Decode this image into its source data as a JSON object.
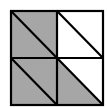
{
  "diagram": {
    "colors": {
      "shaded": "#a6a6a6",
      "unshaded": "#ffffff",
      "stroke": "#000000"
    },
    "cells": [
      {
        "position": "top-left",
        "upper_right_triangle": "shaded",
        "lower_left_triangle": "shaded"
      },
      {
        "position": "top-right",
        "upper_right_triangle": "unshaded",
        "lower_left_triangle": "unshaded"
      },
      {
        "position": "bottom-left",
        "upper_right_triangle": "shaded",
        "lower_left_triangle": "shaded"
      },
      {
        "position": "bottom-right",
        "upper_right_triangle": "unshaded",
        "lower_left_triangle": "shaded"
      }
    ],
    "shaded_triangles": 5,
    "total_triangles": 8
  }
}
